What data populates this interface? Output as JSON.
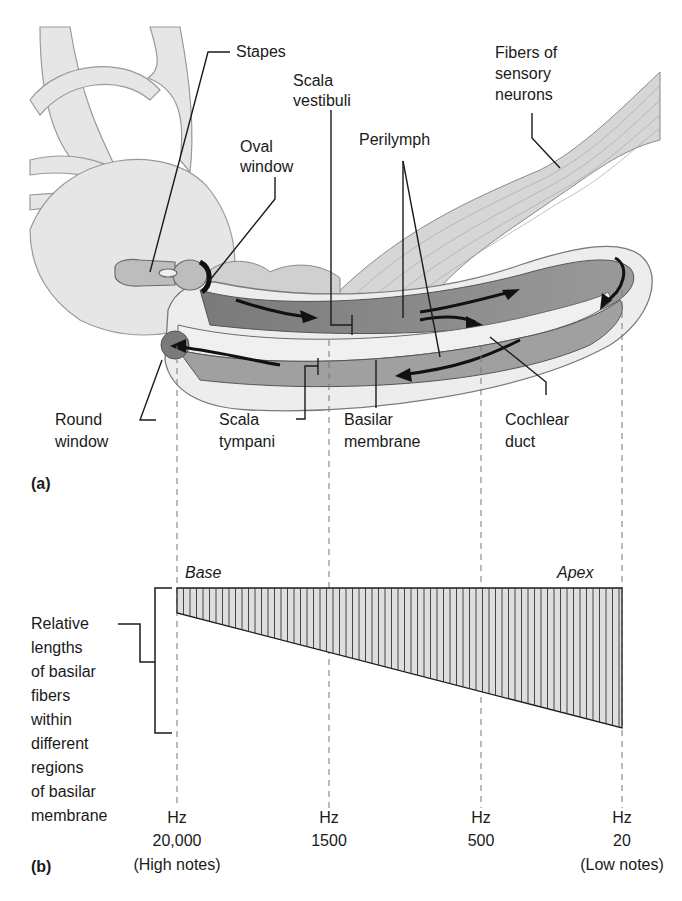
{
  "figure": {
    "panel_a": {
      "tag": "(a)",
      "labels": {
        "stapes": "Stapes",
        "scala_vestibuli": [
          "Scala",
          "vestibuli"
        ],
        "oval_window": [
          "Oval",
          "window"
        ],
        "perilymph": "Perilymph",
        "fibers": [
          "Fibers of",
          "sensory",
          "neurons"
        ],
        "round_window": [
          "Round",
          "window"
        ],
        "scala_tympani": [
          "Scala",
          "tympani"
        ],
        "basilar_membrane": [
          "Basilar",
          "membrane"
        ],
        "cochlear_duct": [
          "Cochlear",
          "duct"
        ]
      }
    },
    "panel_b": {
      "tag": "(b)",
      "base_label": "Base",
      "apex_label": "Apex",
      "side_label": [
        "Relative",
        "lengths",
        "of basilar",
        "fibers",
        "within",
        "different",
        "regions",
        "of basilar",
        "membrane"
      ],
      "ticks": [
        {
          "unit": "Hz",
          "value": "20,000",
          "note": "(High notes)"
        },
        {
          "unit": "Hz",
          "value": "1500",
          "note": ""
        },
        {
          "unit": "Hz",
          "value": "500",
          "note": ""
        },
        {
          "unit": "Hz",
          "value": "20",
          "note": "(Low notes)"
        }
      ]
    },
    "colors": {
      "line": "#1a1a1a",
      "bone": "#e4e4e4",
      "duct_dark": "#8c8c8c",
      "duct_mid": "#b4b4b4",
      "membrane_light": "#ececec",
      "hatch_fill": "#dedede"
    }
  }
}
